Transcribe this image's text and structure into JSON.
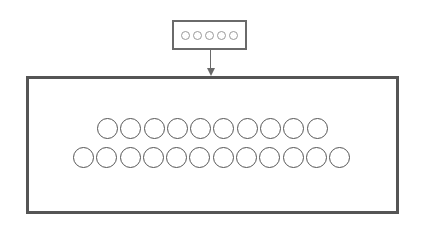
{
  "diagram": {
    "type": "block-flow",
    "colors": {
      "border": "#555555",
      "small_border": "#6a6a6a",
      "small_circle": "#9a9a9a",
      "background": "#ffffff"
    },
    "source_box": {
      "circle_count": 5
    },
    "arrow": {
      "direction": "down"
    },
    "target_box": {
      "rows": [
        {
          "circle_count": 10
        },
        {
          "circle_count": 12
        }
      ]
    }
  }
}
